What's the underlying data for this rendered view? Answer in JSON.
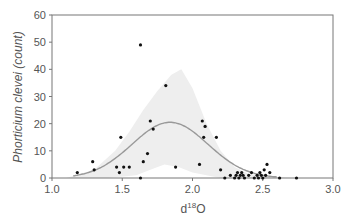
{
  "chart_data": {
    "type": "scatter",
    "title": "",
    "xlabel": "d18O",
    "xlabel_main": "d",
    "xlabel_sup": "18",
    "xlabel_tail": "O",
    "ylabel": "Phorticium clevei (count)",
    "xlim": [
      1.0,
      3.0
    ],
    "ylim": [
      0,
      60
    ],
    "xticks": [
      "1.0",
      "1.5",
      "2.0",
      "2.5",
      "3.0"
    ],
    "yticks": [
      "0",
      "10",
      "20",
      "30",
      "40",
      "50",
      "60"
    ],
    "grid": false,
    "legend": null,
    "points": [
      {
        "x": 1.18,
        "y": 2
      },
      {
        "x": 1.29,
        "y": 6
      },
      {
        "x": 1.3,
        "y": 3
      },
      {
        "x": 1.46,
        "y": 4
      },
      {
        "x": 1.48,
        "y": 2
      },
      {
        "x": 1.49,
        "y": 15
      },
      {
        "x": 1.51,
        "y": 4
      },
      {
        "x": 1.55,
        "y": 4
      },
      {
        "x": 1.63,
        "y": 0
      },
      {
        "x": 1.63,
        "y": 49
      },
      {
        "x": 1.65,
        "y": 6
      },
      {
        "x": 1.68,
        "y": 9
      },
      {
        "x": 1.7,
        "y": 21
      },
      {
        "x": 1.72,
        "y": 18
      },
      {
        "x": 1.81,
        "y": 34
      },
      {
        "x": 1.88,
        "y": 4
      },
      {
        "x": 2.05,
        "y": 5
      },
      {
        "x": 2.07,
        "y": 21
      },
      {
        "x": 2.09,
        "y": 19
      },
      {
        "x": 2.08,
        "y": 15
      },
      {
        "x": 2.17,
        "y": 15
      },
      {
        "x": 2.2,
        "y": 3
      },
      {
        "x": 2.23,
        "y": 0
      },
      {
        "x": 2.27,
        "y": 1
      },
      {
        "x": 2.3,
        "y": 0
      },
      {
        "x": 2.31,
        "y": 1
      },
      {
        "x": 2.32,
        "y": 2
      },
      {
        "x": 2.33,
        "y": 0
      },
      {
        "x": 2.34,
        "y": 1
      },
      {
        "x": 2.35,
        "y": 2
      },
      {
        "x": 2.36,
        "y": 1
      },
      {
        "x": 2.37,
        "y": 0
      },
      {
        "x": 2.4,
        "y": 1
      },
      {
        "x": 2.42,
        "y": 2
      },
      {
        "x": 2.44,
        "y": 0
      },
      {
        "x": 2.46,
        "y": 1
      },
      {
        "x": 2.47,
        "y": 0
      },
      {
        "x": 2.48,
        "y": 2
      },
      {
        "x": 2.49,
        "y": 1
      },
      {
        "x": 2.5,
        "y": 0
      },
      {
        "x": 2.51,
        "y": 3
      },
      {
        "x": 2.52,
        "y": 1
      },
      {
        "x": 2.53,
        "y": 5
      },
      {
        "x": 2.55,
        "y": 2
      },
      {
        "x": 2.62,
        "y": 0
      },
      {
        "x": 2.74,
        "y": 0
      }
    ],
    "fit_curve": {
      "type": "gaussian",
      "peak_x": 1.84,
      "peak_y": 20.5,
      "sigma": 0.27,
      "color": "#999999"
    },
    "confidence_band": {
      "color": "#eeeeee",
      "upper": [
        [
          1.1,
          0
        ],
        [
          1.3,
          3
        ],
        [
          1.45,
          10
        ],
        [
          1.55,
          17
        ],
        [
          1.65,
          25
        ],
        [
          1.75,
          32
        ],
        [
          1.85,
          38
        ],
        [
          1.92,
          40
        ],
        [
          2.0,
          33
        ],
        [
          2.1,
          20
        ],
        [
          2.2,
          10
        ],
        [
          2.3,
          4
        ],
        [
          2.4,
          1.5
        ],
        [
          2.55,
          0.5
        ],
        [
          2.7,
          0
        ]
      ],
      "lower": [
        [
          2.7,
          0
        ],
        [
          2.4,
          0
        ],
        [
          2.2,
          0
        ],
        [
          2.0,
          2
        ],
        [
          1.9,
          4
        ],
        [
          1.8,
          5
        ],
        [
          1.7,
          3
        ],
        [
          1.6,
          1
        ],
        [
          1.4,
          0
        ],
        [
          1.1,
          0
        ]
      ]
    },
    "colors": {
      "axis": "#777777",
      "point": "#111111",
      "text": "#555555"
    }
  }
}
